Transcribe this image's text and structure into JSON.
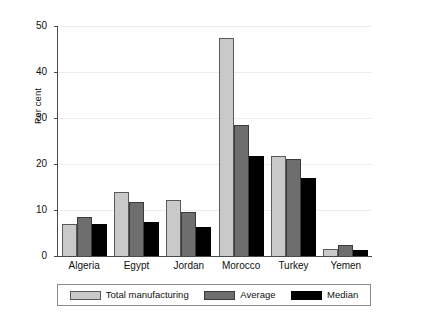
{
  "chart_data": {
    "type": "bar",
    "title": "",
    "subtitle": "",
    "xlabel": "",
    "ylabel": "Per cent",
    "ylim": [
      0,
      50
    ],
    "yticks": [
      0,
      10,
      20,
      30,
      40,
      50
    ],
    "ytick_labels": [
      "0",
      "10",
      "20",
      "30",
      "40",
      "50"
    ],
    "grid": true,
    "legend_position": "bottom",
    "categories": [
      "Algeria",
      "Egypt",
      "Jordan",
      "Morocco",
      "Turkey",
      "Yemen"
    ],
    "series": [
      {
        "name": "Total manufacturing",
        "color": "#c9c9c9",
        "values": [
          7.0,
          13.9,
          12.2,
          47.5,
          21.7,
          1.6
        ]
      },
      {
        "name": "Average",
        "color": "#6e6e6e",
        "values": [
          8.4,
          11.8,
          9.6,
          28.5,
          21.0,
          2.5
        ]
      },
      {
        "name": "Median",
        "color": "#000000",
        "values": [
          7.0,
          7.4,
          6.2,
          21.8,
          17.0,
          1.3
        ]
      }
    ]
  },
  "legend": {
    "items": [
      {
        "label": "Total manufacturing"
      },
      {
        "label": "Average"
      },
      {
        "label": "Median"
      }
    ]
  }
}
